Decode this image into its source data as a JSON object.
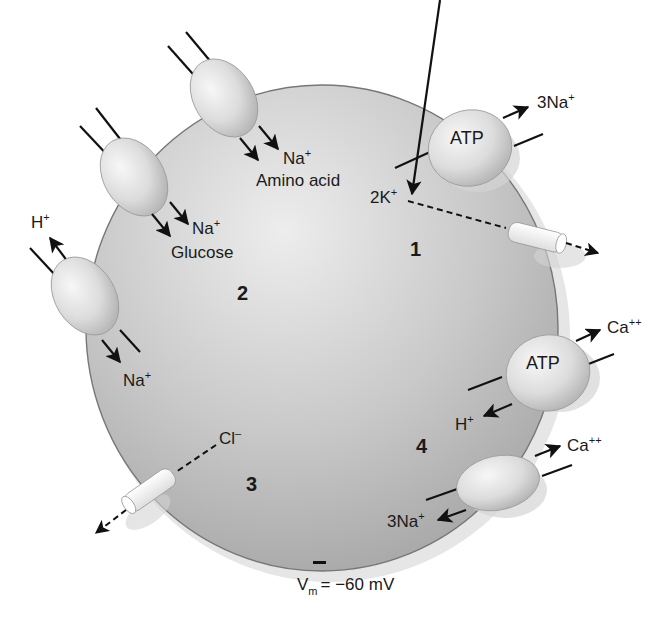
{
  "diagram": {
    "type": "cell-membrane-transport",
    "membrane_potential": {
      "symbol": "V",
      "subscript": "m",
      "value_text": "= −60 mV",
      "interior_sign": "–"
    },
    "colors": {
      "cell_fill_light": "#e6e6e6",
      "cell_fill_dark": "#a9a9a9",
      "cell_edge": "#6e6e6e",
      "protein_light": "#f4f4f4",
      "protein_dark": "#bdbdbd",
      "channel_fill": "#f7f7f7",
      "arrow": "#111111",
      "shadow": "#cfcfcf"
    },
    "region_numbers": [
      "1",
      "2",
      "3",
      "4"
    ],
    "transporters": [
      {
        "id": "na-k-atpase",
        "region": "1",
        "label": "ATP",
        "out_ion": {
          "base": "3Na",
          "charge": "+"
        },
        "in_ion": {
          "base": "2K",
          "charge": "+"
        }
      },
      {
        "id": "na-amino-acid-symporter",
        "region": "2",
        "ions": [
          {
            "base": "Na",
            "charge": "+"
          }
        ],
        "cosubstrate": "Amino acid"
      },
      {
        "id": "na-glucose-symporter",
        "region": "2",
        "ions": [
          {
            "base": "Na",
            "charge": "+"
          }
        ],
        "cosubstrate": "Glucose"
      },
      {
        "id": "na-h-exchanger",
        "region": "2",
        "out_ion": {
          "base": "H",
          "charge": "+"
        },
        "in_ion": {
          "base": "Na",
          "charge": "+"
        }
      },
      {
        "id": "ca-h-atpase",
        "region": "4",
        "label": "ATP",
        "out_ion": {
          "base": "Ca",
          "charge": "++"
        },
        "in_ion": {
          "base": "H",
          "charge": "+"
        }
      },
      {
        "id": "na-ca-exchanger",
        "region": "4",
        "out_ion": {
          "base": "Ca",
          "charge": "++"
        },
        "in_ion": {
          "base": "3Na",
          "charge": "+"
        }
      }
    ],
    "channels": [
      {
        "id": "k-channel",
        "region": "1",
        "ion": {
          "base": "2K",
          "charge": "+"
        },
        "direction": "out"
      },
      {
        "id": "cl-channel",
        "region": "3",
        "ion": {
          "base": "Cl",
          "charge": "–"
        },
        "direction": "out"
      }
    ]
  },
  "labels": {
    "n1": "1",
    "n2": "2",
    "n3": "3",
    "n4": "4",
    "atp_top": "ATP",
    "atp_bottom": "ATP",
    "na3_top_base": "3Na",
    "na3_top_sup": "+",
    "k2_base": "2K",
    "k2_sup": "+",
    "na_amino_base": "Na",
    "na_amino_sup": "+",
    "amino_acid": "Amino acid",
    "na_glucose_base": "Na",
    "na_glucose_sup": "+",
    "glucose": "Glucose",
    "h_out_base": "H",
    "h_out_sup": "+",
    "na_in_base": "Na",
    "na_in_sup": "+",
    "ca_top_base": "Ca",
    "ca_top_sup": "++",
    "h_in_base": "H",
    "h_in_sup": "+",
    "ca_bottom_base": "Ca",
    "ca_bottom_sup": "++",
    "na3_bottom_base": "3Na",
    "na3_bottom_sup": "+",
    "cl_base": "Cl",
    "cl_sup": "–",
    "minus_sign": "–",
    "vm_base": "V",
    "vm_sub": "m",
    "vm_value": "= −60 mV"
  }
}
